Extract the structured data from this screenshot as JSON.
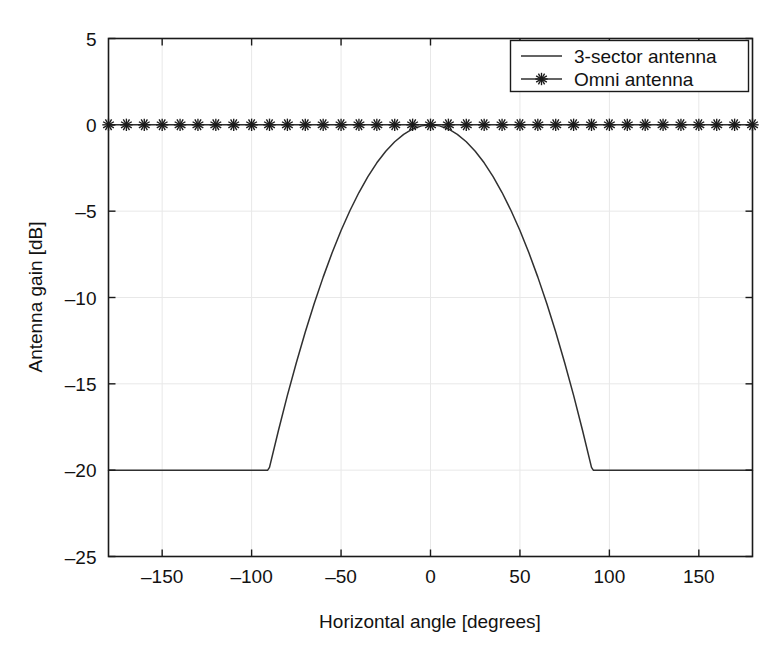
{
  "chart_data": {
    "type": "line",
    "title": "",
    "xlabel": "Horizontal angle [degrees]",
    "ylabel": "Antenna gain [dB]",
    "xlim": [
      -180,
      180
    ],
    "ylim": [
      -25,
      5
    ],
    "xticks": [
      -150,
      -100,
      -50,
      0,
      50,
      100,
      150
    ],
    "xtick_labels": [
      "-150",
      "-100",
      "-50",
      "0",
      "50",
      "100",
      "150"
    ],
    "yticks": [
      5,
      0,
      -5,
      -10,
      -15,
      -20,
      -25
    ],
    "ytick_labels": [
      "5",
      "0",
      "-5",
      "-10",
      "-15",
      "-20",
      "-25"
    ],
    "grid": true,
    "legend_position": "upper right",
    "series": [
      {
        "name": "3-sector antenna",
        "style": "line",
        "marker": "none",
        "color": "#303030",
        "model": "3GPP: A(theta) = -min(12*(theta/70)^2, 20)",
        "theta_3db": 70,
        "front_to_back_db": 20,
        "x": [
          -180,
          -170,
          -160,
          -150,
          -140,
          -130,
          -120,
          -110,
          -100,
          -91,
          -90,
          -85,
          -80,
          -75,
          -70,
          -65,
          -60,
          -55,
          -50,
          -45,
          -40,
          -35,
          -30,
          -25,
          -20,
          -15,
          -10,
          -5,
          0,
          5,
          10,
          15,
          20,
          25,
          30,
          35,
          40,
          45,
          50,
          55,
          60,
          65,
          70,
          75,
          80,
          85,
          90,
          91,
          100,
          110,
          120,
          130,
          140,
          150,
          160,
          170,
          180
        ],
        "y": [
          -20,
          -20,
          -20,
          -20,
          -20,
          -20,
          -20,
          -20,
          -20,
          -20,
          -19.84,
          -17.7,
          -15.67,
          -13.78,
          -12,
          -10.35,
          -8.82,
          -7.41,
          -6.12,
          -4.96,
          -3.92,
          -3,
          -2.2,
          -1.53,
          -0.98,
          -0.55,
          -0.24,
          -0.06,
          0,
          -0.06,
          -0.24,
          -0.55,
          -0.98,
          -1.53,
          -2.2,
          -3,
          -3.92,
          -4.96,
          -6.12,
          -7.41,
          -8.82,
          -10.35,
          -12,
          -13.78,
          -15.67,
          -17.7,
          -19.84,
          -20,
          -20,
          -20,
          -20,
          -20,
          -20,
          -20,
          -20,
          -20,
          -20
        ]
      },
      {
        "name": "Omni antenna",
        "style": "line-marker",
        "marker": "star",
        "color": "#1a1a1a",
        "constant_value": 0,
        "marker_step_degrees": 10,
        "x": [
          -180,
          -170,
          -160,
          -150,
          -140,
          -130,
          -120,
          -110,
          -100,
          -90,
          -80,
          -70,
          -60,
          -50,
          -40,
          -30,
          -20,
          -10,
          0,
          10,
          20,
          30,
          40,
          50,
          60,
          70,
          80,
          90,
          100,
          110,
          120,
          130,
          140,
          150,
          160,
          170,
          180
        ],
        "y": [
          0,
          0,
          0,
          0,
          0,
          0,
          0,
          0,
          0,
          0,
          0,
          0,
          0,
          0,
          0,
          0,
          0,
          0,
          0,
          0,
          0,
          0,
          0,
          0,
          0,
          0,
          0,
          0,
          0,
          0,
          0,
          0,
          0,
          0,
          0,
          0,
          0
        ]
      }
    ],
    "legend_entries": [
      {
        "label": "3-sector antenna",
        "marker": "none"
      },
      {
        "label": "Omni antenna",
        "marker": "star"
      }
    ]
  }
}
